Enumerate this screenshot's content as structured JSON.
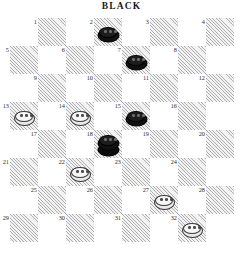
{
  "header": {
    "title": "BLACK"
  },
  "board": {
    "rows": 8,
    "cols": 8,
    "numbered_squares": 32,
    "dark_square_color": "#f2f2f2",
    "light_square_color": "#ffffff",
    "hatch_color": "#787878",
    "square_numbers": [
      "1",
      "2",
      "3",
      "4",
      "5",
      "6",
      "7",
      "8",
      "9",
      "10",
      "11",
      "12",
      "13",
      "14",
      "15",
      "16",
      "17",
      "18",
      "19",
      "20",
      "21",
      "22",
      "23",
      "24",
      "25",
      "26",
      "27",
      "28",
      "29",
      "30",
      "31",
      "32"
    ],
    "pieces": [
      {
        "square": 2,
        "color": "black",
        "type": "man",
        "label": "black-man-2"
      },
      {
        "square": 7,
        "color": "black",
        "type": "man",
        "label": "black-man-7"
      },
      {
        "square": 13,
        "color": "white",
        "type": "man",
        "label": "white-man-13"
      },
      {
        "square": 14,
        "color": "white",
        "type": "man",
        "label": "white-man-14"
      },
      {
        "square": 15,
        "color": "black",
        "type": "man",
        "label": "black-man-15"
      },
      {
        "square": 18,
        "color": "black",
        "type": "king",
        "label": "black-king-18"
      },
      {
        "square": 22,
        "color": "white",
        "type": "man",
        "label": "white-man-22"
      },
      {
        "square": 27,
        "color": "white",
        "type": "man",
        "label": "white-man-27"
      },
      {
        "square": 32,
        "color": "white",
        "type": "man",
        "label": "white-man-32"
      }
    ],
    "piece_counts": {
      "black": "4",
      "white": "5"
    }
  }
}
